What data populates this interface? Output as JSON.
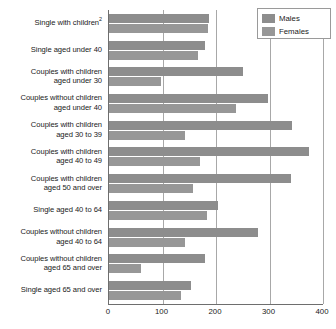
{
  "chart_data": {
    "type": "bar",
    "orientation": "horizontal",
    "title": "",
    "xlabel": "",
    "ylabel": "",
    "xlim": [
      0,
      400
    ],
    "xticks": [
      0,
      100,
      200,
      300,
      400
    ],
    "grid": true,
    "legend_position": "top-right",
    "categories": [
      "Single with children²",
      "Single aged under 40",
      "Couples with children aged under 30",
      "Couples without children aged under 40",
      "Couples with children aged 30 to 39",
      "Couples with children aged 40 to 49",
      "Couples with children aged 50 and over",
      "Single aged 40 to 64",
      "Couples without children aged 40 to 64",
      "Couples without children aged 65 and over",
      "Single aged 65 and over"
    ],
    "category_lines": [
      [
        "Single with children",
        "2"
      ],
      [
        "Single aged under 40",
        ""
      ],
      [
        "Couples with children",
        "aged under 30"
      ],
      [
        "Couples without children",
        "aged under 40"
      ],
      [
        "Couples with children",
        "aged 30 to 39"
      ],
      [
        "Couples with children",
        "aged 40 to 49"
      ],
      [
        "Couples with children",
        "aged 50 and over"
      ],
      [
        "Single aged 40 to 64",
        ""
      ],
      [
        "Couples without children",
        "aged 40 to 64"
      ],
      [
        "Couples without children",
        "aged 65 and over"
      ],
      [
        "Single aged 65 and over",
        ""
      ]
    ],
    "series": [
      {
        "name": "Males",
        "color": "#8d8d8d",
        "values": [
          187,
          180,
          250,
          297,
          342,
          374,
          340,
          203,
          278,
          180,
          153
        ]
      },
      {
        "name": "Females",
        "color": "#979797",
        "values": [
          185,
          167,
          97,
          238,
          142,
          170,
          157,
          183,
          142,
          60,
          135
        ]
      }
    ]
  },
  "legend": {
    "items": [
      {
        "label": "Males",
        "color": "#8d8d8d"
      },
      {
        "label": "Females",
        "color": "#979797"
      }
    ]
  },
  "axis": {
    "tick_labels": [
      "0",
      "100",
      "200",
      "300",
      "400"
    ]
  }
}
